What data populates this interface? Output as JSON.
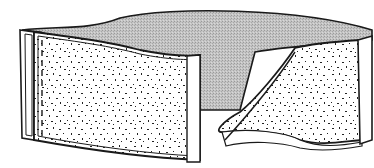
{
  "figure": {
    "style": "black-and-white line drawing",
    "colors": {
      "background": "#ffffff",
      "outline": "#1a1a1a",
      "inner_surface": "#bdbdbd",
      "textured_surface": "#ffffff",
      "speckle": "#2a2a2a"
    },
    "labels": []
  }
}
